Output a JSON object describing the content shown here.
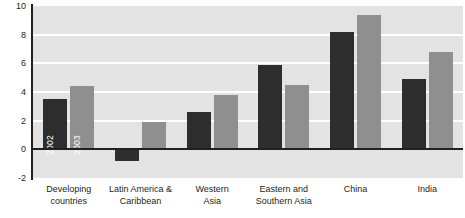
{
  "chart_data": {
    "type": "bar",
    "title": "",
    "subtitle": "",
    "xlabel": "",
    "ylabel": "",
    "ylim": [
      -2,
      10
    ],
    "yticks": [
      10,
      8,
      6,
      4,
      2,
      0,
      -2
    ],
    "grid": true,
    "gridlines_at": [
      8,
      6,
      4,
      2
    ],
    "legend_position": "in-bars",
    "legend_style": "inline labels inside first group bars",
    "categories": [
      "Developing countries",
      "Latin America & Caribbean",
      "Western Asia",
      "Eastern and Southern Asia",
      "China",
      "India"
    ],
    "category_lines": [
      [
        "Developing",
        "countries"
      ],
      [
        "Latin America &",
        "Caribbean"
      ],
      [
        "Western",
        "Asia"
      ],
      [
        "Eastern and",
        "Southern Asia"
      ],
      [
        "China"
      ],
      [
        "India"
      ]
    ],
    "series": [
      {
        "name": "2002",
        "color": "#2d2d2d",
        "values": [
          3.5,
          -0.8,
          2.6,
          5.9,
          8.2,
          4.9
        ]
      },
      {
        "name": "2003",
        "color": "#8f8f8f",
        "values": [
          4.4,
          1.9,
          3.8,
          4.5,
          9.4,
          6.8
        ]
      }
    ]
  },
  "style": {
    "plot_background": "#e3e3e3",
    "page_background": "#ffffff",
    "gridline_color": "#ffffff",
    "axis_color": "#231f20",
    "text_color": "#231f20"
  }
}
